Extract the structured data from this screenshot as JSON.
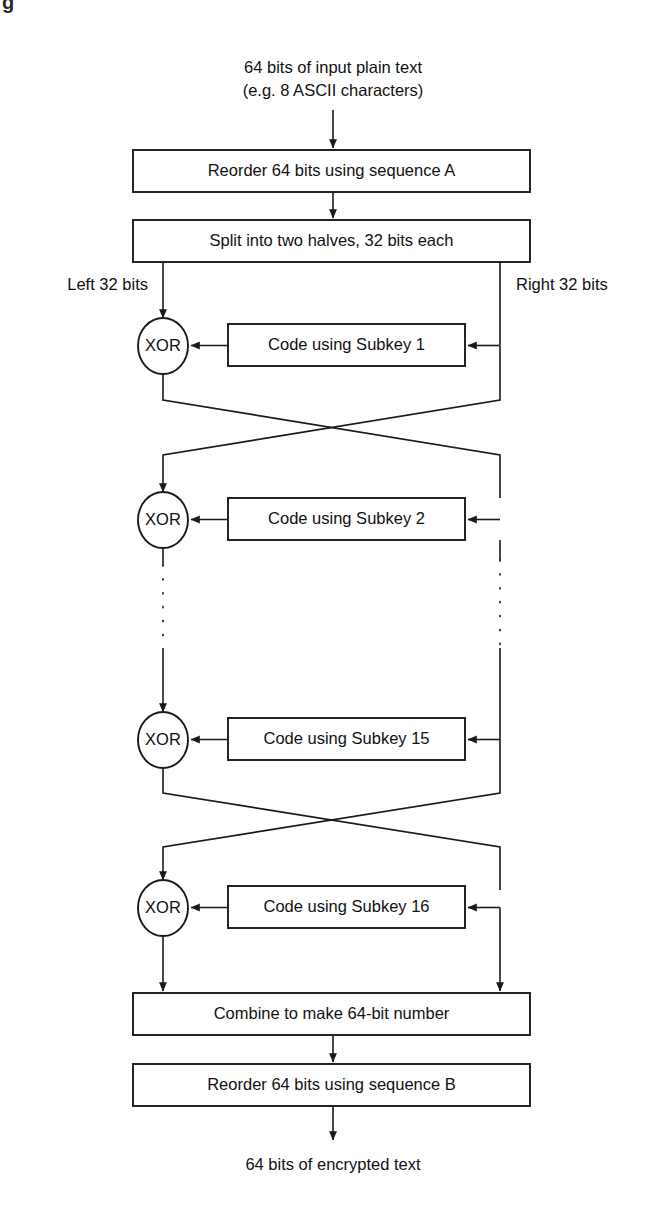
{
  "figure": {
    "corner_fragment": "g",
    "title_top": "64 bits of input plain text",
    "subtitle_top": "(e.g. 8 ASCII characters)",
    "output_text": "64 bits of encrypted text"
  },
  "boxes": {
    "reorder_a": "Reorder 64 bits using sequence A",
    "split": "Split into two halves, 32 bits each",
    "combine": "Combine to make 64-bit number",
    "reorder_b": "Reorder 64 bits using sequence B"
  },
  "branch_labels": {
    "left": "Left 32 bits",
    "right": "Right 32 bits"
  },
  "rounds": [
    {
      "xor": "XOR",
      "code_box": "Code using Subkey 1"
    },
    {
      "xor": "XOR",
      "code_box": "Code using Subkey 2"
    },
    {
      "xor": "XOR",
      "code_box": "Code using Subkey 15"
    },
    {
      "xor": "XOR",
      "code_box": "Code using Subkey 16"
    }
  ],
  "colors": {
    "ink": "#1a1a1a",
    "paper": "#ffffff"
  }
}
